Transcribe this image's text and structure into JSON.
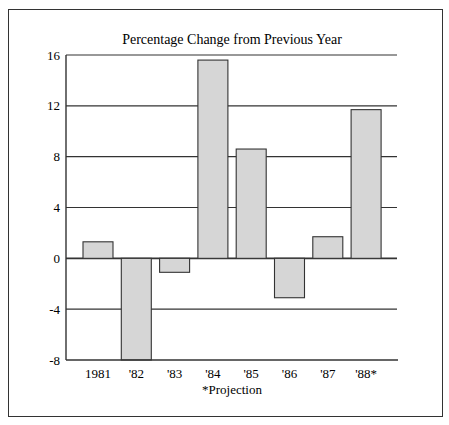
{
  "chart_data": {
    "type": "bar",
    "title": "Percentage Change from Previous Year",
    "xlabel": "",
    "ylabel": "",
    "categories": [
      "1981",
      "'82",
      "'83",
      "'84",
      "'85",
      "'86",
      "'87",
      "'88*"
    ],
    "values": [
      1.3,
      -8.0,
      -1.1,
      15.6,
      8.6,
      -3.1,
      1.7,
      11.7
    ],
    "ylim": [
      -8,
      16
    ],
    "yticks": [
      16,
      12,
      8,
      4,
      0,
      -4,
      -8
    ],
    "ytick_labels": [
      "16",
      "12",
      "8",
      "4",
      "0",
      "-4",
      "-8"
    ],
    "grid": true,
    "legend": null,
    "annotations": [
      "*Projection"
    ],
    "bar_color": "#d6d6d6",
    "edge_color": "#333333"
  },
  "footnote": "*Projection"
}
